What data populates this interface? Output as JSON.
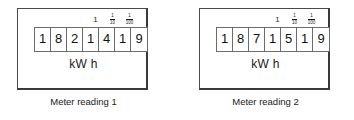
{
  "figure": {
    "background_color": "#ffffff",
    "line_color": "#3a3a3a",
    "text_color": "#1a1a1a"
  },
  "meters": [
    {
      "id": "meter-1",
      "caption": "Meter reading 1",
      "unit_label": "kW h",
      "digits": [
        "1",
        "8",
        "2",
        "1",
        "4",
        "1",
        "9"
      ],
      "reading": "1821419",
      "scale_labels": [
        {
          "type": "integer",
          "text": "1"
        },
        {
          "type": "fraction",
          "numerator": "1",
          "denominator": "10",
          "text": "1/10"
        },
        {
          "type": "fraction",
          "numerator": "1",
          "denominator": "100",
          "text": "1/100"
        }
      ]
    },
    {
      "id": "meter-2",
      "caption": "Meter reading 2",
      "unit_label": "kW h",
      "digits": [
        "1",
        "8",
        "7",
        "1",
        "5",
        "1",
        "9"
      ],
      "reading": "1871519",
      "scale_labels": [
        {
          "type": "integer",
          "text": "1"
        },
        {
          "type": "fraction",
          "numerator": "1",
          "denominator": "10",
          "text": "1/10"
        },
        {
          "type": "fraction",
          "numerator": "1",
          "denominator": "100",
          "text": "1/100"
        }
      ]
    }
  ]
}
